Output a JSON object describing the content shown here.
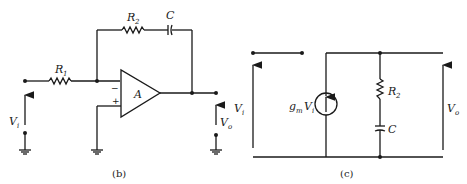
{
  "figure_b": {
    "caption": "(b)",
    "labels": {
      "R1": "R",
      "R1_sub": "1",
      "R2": "R",
      "R2_sub": "2",
      "C": "C",
      "amp": "A",
      "minus": "−",
      "plus": "+",
      "Vi": "V",
      "Vi_sub": "i",
      "Vo": "V",
      "Vo_sub": "o"
    }
  },
  "figure_c": {
    "caption": "(c)",
    "labels": {
      "Vi": "V",
      "Vi_sub": "i",
      "gm": "g",
      "gm_sub": "m",
      "gmVi": "V",
      "gmVi_sub": "i",
      "R2": "R",
      "R2_sub": "2",
      "C": "C",
      "Vo": "V",
      "Vo_sub": "o"
    }
  },
  "colors": {
    "ink": "#1a1a1a",
    "background": "#ffffff"
  }
}
